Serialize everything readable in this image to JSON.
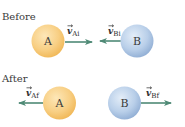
{
  "before": {
    "label": "Before",
    "ball_a": {
      "letter": "A",
      "velocity_symbol": "v",
      "velocity_subscript": "Ai",
      "direction": "right"
    },
    "ball_b": {
      "letter": "B",
      "velocity_symbol": "v",
      "velocity_subscript": "Bi",
      "direction": "left"
    }
  },
  "after": {
    "label": "After",
    "ball_a": {
      "letter": "A",
      "velocity_symbol": "v",
      "velocity_subscript": "Af",
      "direction": "left"
    },
    "ball_b": {
      "letter": "B",
      "velocity_symbol": "v",
      "velocity_subscript": "Bf",
      "direction": "right"
    }
  },
  "colors": {
    "ball_a": "#f5c36b",
    "ball_a_highlight": "#fde7b8",
    "ball_b": "#a9c4e4",
    "ball_b_highlight": "#e3edf8",
    "arrow": "#4f8a76",
    "text": "#333333"
  }
}
